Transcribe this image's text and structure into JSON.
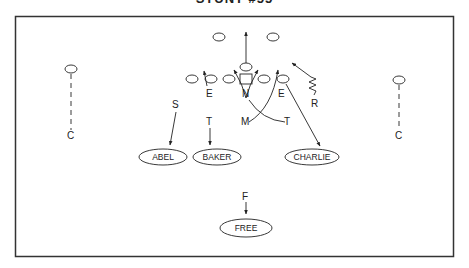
{
  "diagram": {
    "title": "STUNT #55",
    "defenders": {
      "left_corner": "C",
      "right_corner": "C",
      "strong_safety": "S",
      "left_end": "E",
      "nose": "N",
      "right_end": "E",
      "left_tackle": "T",
      "mike": "M",
      "right_tackle": "T",
      "rover": "R",
      "free_safety": "F"
    },
    "zones": {
      "abel": "ABEL",
      "baker": "BAKER",
      "charlie": "CHARLIE",
      "free": "FREE"
    }
  }
}
